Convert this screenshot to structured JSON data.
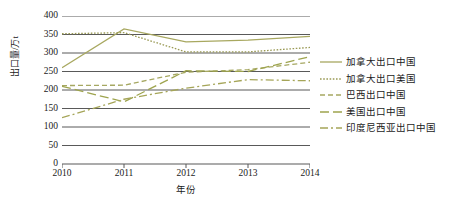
{
  "chart_data": {
    "type": "line",
    "title": "",
    "xlabel": "年份",
    "ylabel": "出口量/万t",
    "x": [
      2010,
      2011,
      2012,
      2013,
      2014
    ],
    "xtick_labels": [
      "2010",
      "2011",
      "2012",
      "2013",
      "2014"
    ],
    "ytick_labels": [
      "0",
      "50",
      "100",
      "150",
      "200",
      "250",
      "300",
      "350",
      "400"
    ],
    "yticks": [
      0,
      50,
      100,
      150,
      200,
      250,
      300,
      350,
      400
    ],
    "ylim": [
      0,
      400
    ],
    "xlim": [
      2010,
      2014
    ],
    "grid": "horizontal",
    "legend_position": "right",
    "series": [
      {
        "name": "加拿大出口中国",
        "values": [
          260,
          365,
          330,
          335,
          345
        ],
        "color": "#a8a860",
        "dash": "solid",
        "dasharray": "",
        "width": 1.3
      },
      {
        "name": "加拿大出口美国",
        "values": [
          352,
          355,
          303,
          303,
          315
        ],
        "color": "#9a9a55",
        "dash": "dotted",
        "dasharray": "1.6,1.6",
        "width": 1.3
      },
      {
        "name": "巴西出口中国",
        "values": [
          212,
          213,
          248,
          255,
          275
        ],
        "color": "#a6a862",
        "dash": "dashed",
        "dasharray": "5,3",
        "width": 1.3
      },
      {
        "name": "美国出口中国",
        "values": [
          210,
          168,
          252,
          250,
          290
        ],
        "color": "#9ea44e",
        "dash": "long-dash",
        "dasharray": "9,4",
        "width": 1.3
      },
      {
        "name": "印度尼西亚出口中国",
        "values": [
          125,
          175,
          205,
          228,
          225
        ],
        "color": "#a5a558",
        "dash": "dash-dot",
        "dasharray": "8,3,2,3",
        "width": 1.3
      }
    ],
    "axis_color": "#595959",
    "grid_color": "#595959",
    "background": "#ffffff"
  },
  "legend": {
    "items": [
      {
        "label": "加拿大出口中国"
      },
      {
        "label": "加拿大出口美国"
      },
      {
        "label": "巴西出口中国"
      },
      {
        "label": "美国出口中国"
      },
      {
        "label": "印度尼西亚出口中国"
      }
    ]
  }
}
